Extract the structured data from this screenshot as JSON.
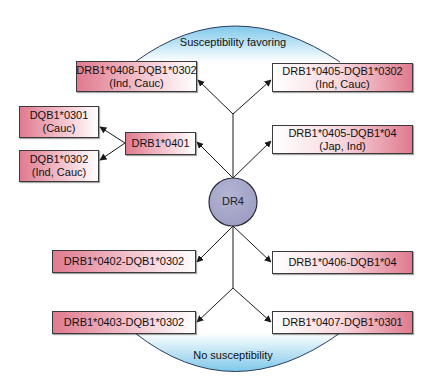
{
  "diagram": {
    "zones": {
      "top": "Susceptibility favoring",
      "bottom": "No susceptibility"
    },
    "center": {
      "label": "DR4",
      "fill": "#a9a9cc"
    },
    "nodes": {
      "drb1_0408": {
        "line1": "DRB1*0408-DQB1*0302",
        "line2": "(Ind, Cauc)"
      },
      "drb1_0405_0302": {
        "line1": "DRB1*0405-DQB1*0302",
        "line2": "(Ind, Cauc)"
      },
      "dqb1_0301": {
        "line1": "DQB1*0301",
        "line2": "(Cauc)"
      },
      "dqb1_0302": {
        "line1": "DQB1*0302",
        "line2": "(Ind, Cauc)"
      },
      "drb1_0401": {
        "line1": "DRB1*0401"
      },
      "drb1_0405_04": {
        "line1": "DRB1*0405-DQB1*04",
        "line2": "(Jap, Ind)"
      },
      "drb1_0402": {
        "line1": "DRB1*0402-DQB1*0302"
      },
      "drb1_0406": {
        "line1": "DRB1*0406-DQB1*04"
      },
      "drb1_0403": {
        "line1": "DRB1*0403-DQB1*0302"
      },
      "drb1_0407": {
        "line1": "DRB1*0407-DQB1*0301"
      }
    },
    "colors": {
      "pink": "#e07a8f",
      "arc_blue": "#7ec8ea",
      "arc_stroke": "#2b3d5c",
      "line": "#1a1a1a"
    }
  }
}
